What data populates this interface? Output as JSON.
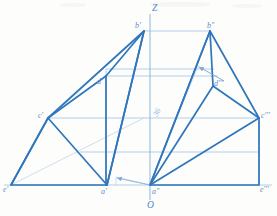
{
  "drawing": {
    "type": "descriptive-geometry-projection",
    "background_color": "#fdfdfc",
    "thick_line_color": "#2f76bd",
    "thin_line_color": "#9cc3e3",
    "faint_line_color": "#b9cfe4",
    "label_color": "#5b8fc9",
    "axis_label_color": "#4a86c8"
  },
  "axis": {
    "z_label": "Z",
    "origin_label": "O"
  },
  "labels": {
    "b_prime": "b'",
    "b_double_prime": "b\"",
    "d_prime": "d'",
    "d_triple_prime": "d'''",
    "c_prime": "c'",
    "c_triple_prime": "c'''",
    "e_prime": "e'",
    "e_triple_prime": "e'''",
    "a_prime": "a'",
    "a_double_prime": "a\"",
    "dimension": "36"
  },
  "points": {
    "b_prime": {
      "x": 144,
      "y": 31
    },
    "b_double_prime": {
      "x": 210,
      "y": 31
    },
    "d_prime": {
      "x": 106,
      "y": 76
    },
    "d_triple_prime": {
      "x": 213,
      "y": 86
    },
    "c_prime": {
      "x": 48,
      "y": 118
    },
    "c_triple_prime": {
      "x": 259,
      "y": 118
    },
    "e_prime": {
      "x": 11,
      "y": 185
    },
    "e_triple_prime": {
      "x": 259,
      "y": 185
    },
    "a_prime": {
      "x": 107,
      "y": 185
    },
    "a_double_prime": {
      "x": 150,
      "y": 185
    },
    "z_top": {
      "x": 150,
      "y": 14
    },
    "origin": {
      "x": 150,
      "y": 200
    },
    "arrow_upper_tip": {
      "x": 198,
      "y": 66
    },
    "arrow_upper_tail": {
      "x": 224,
      "y": 81
    },
    "arrow_lower_tip": {
      "x": 116,
      "y": 177
    },
    "arrow_lower_tail": {
      "x": 150,
      "y": 185
    }
  }
}
